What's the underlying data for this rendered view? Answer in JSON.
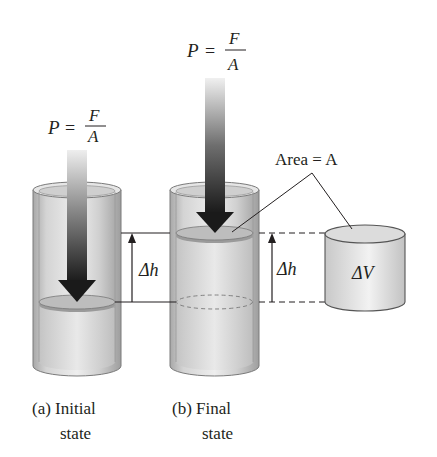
{
  "figure": {
    "panels": [
      {
        "id": "a",
        "caption_line1": "(a) Initial",
        "caption_line2": "state"
      },
      {
        "id": "b",
        "caption_line1": "(b) Final",
        "caption_line2": "state"
      }
    ],
    "pressure_label_a": {
      "lhs": "P",
      "eq": "=",
      "num": "F",
      "den": "A"
    },
    "pressure_label_b": {
      "lhs": "P",
      "eq": "=",
      "num": "F",
      "den": "A"
    },
    "area_label": "Area = A",
    "delta_h_label_a": "Δh",
    "delta_h_label_b": "Δh",
    "delta_v_label": "ΔV"
  },
  "colors": {
    "arrow_dark": "#1a1a1a",
    "cylinder_glass": "#d9d9d9",
    "cylinder_edge": "#7a7a7a",
    "piston": "#b5b5b5",
    "line": "#231f20"
  }
}
